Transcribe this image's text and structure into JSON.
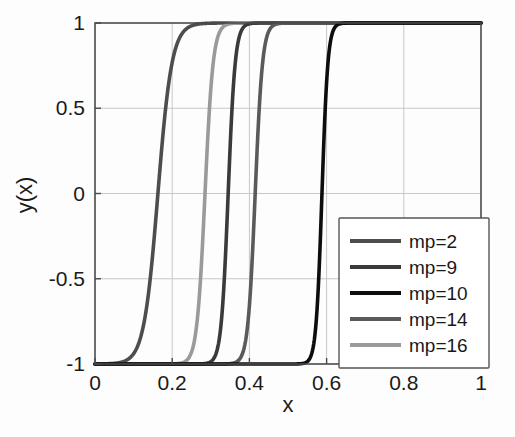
{
  "chart_data": {
    "type": "line",
    "title": "",
    "xlabel": "x",
    "ylabel": "y(x)",
    "xlim": [
      0,
      1
    ],
    "ylim": [
      -1,
      1
    ],
    "xticks": [
      "0",
      "0.2",
      "0.4",
      "0.6",
      "0.8",
      "1"
    ],
    "xtick_values": [
      0,
      0.2,
      0.4,
      0.6,
      0.8,
      1
    ],
    "yticks": [
      "-1",
      "-0.5",
      "0",
      "0.5",
      "1"
    ],
    "ytick_values": [
      -1,
      -0.5,
      0,
      0.5,
      1
    ],
    "grid": true,
    "legend_position": "lower right",
    "series": [
      {
        "name": "mp=2",
        "label": "mp=2",
        "color": "#4d4d4d",
        "midpoint": 0.163,
        "steepness": 55,
        "y_low": -1,
        "y_high": 1
      },
      {
        "name": "mp=16",
        "label": "mp=16",
        "color": "#9a9a9a",
        "midpoint": 0.285,
        "steepness": 95,
        "y_low": -1,
        "y_high": 1
      },
      {
        "name": "mp=9",
        "label": "mp=9",
        "color": "#3a3a3a",
        "midpoint": 0.345,
        "steepness": 110,
        "y_low": -1,
        "y_high": 1
      },
      {
        "name": "mp=14",
        "label": "mp=14",
        "color": "#5a5a5a",
        "midpoint": 0.415,
        "steepness": 105,
        "y_low": -1,
        "y_high": 1
      },
      {
        "name": "mp=10",
        "label": "mp=10",
        "color": "#0d0d0d",
        "midpoint": 0.588,
        "steepness": 130,
        "y_low": -1,
        "y_high": 1
      }
    ],
    "legend_entries": [
      {
        "label": "mp=2",
        "color": "#4d4d4d"
      },
      {
        "label": "mp=9",
        "color": "#3a3a3a"
      },
      {
        "label": "mp=10",
        "color": "#0d0d0d"
      },
      {
        "label": "mp=14",
        "color": "#5a5a5a"
      },
      {
        "label": "mp=16",
        "color": "#9a9a9a"
      }
    ]
  },
  "colors": {
    "background": "#fdfdfd",
    "axis": "#4a4a4a",
    "grid": "#c8c8c8",
    "text": "#1a1a1a"
  }
}
